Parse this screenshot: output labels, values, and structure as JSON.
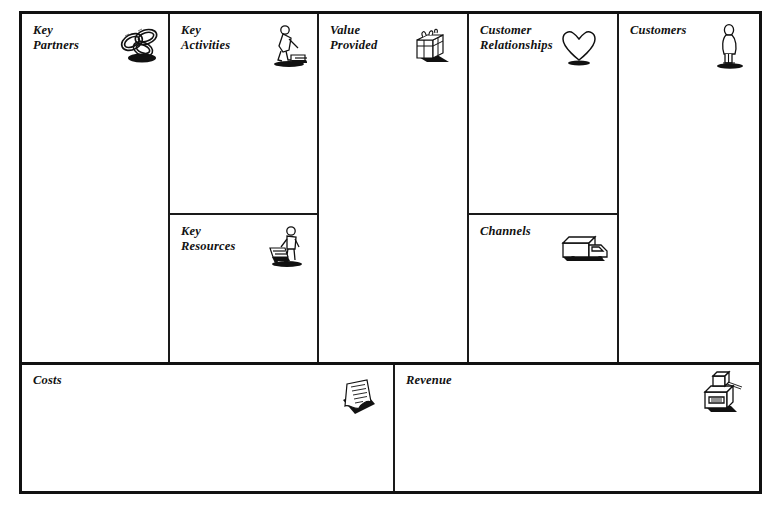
{
  "document": {
    "type": "Business Model Canvas",
    "background_color": "#ffffff",
    "line_color": "#111111",
    "text_color": "#111111"
  },
  "blocks": {
    "key_partners": {
      "label": "Key\nPartners",
      "icon": "interlocking-rings-icon"
    },
    "key_activities": {
      "label": "Key\nActivities",
      "icon": "person-sweeping-icon"
    },
    "key_resources": {
      "label": "Key\nResources",
      "icon": "person-with-cart-icon"
    },
    "value_provided": {
      "label": "Value\nProvided",
      "icon": "gift-box-icon"
    },
    "customer_relationships": {
      "label": "Customer\nRelationships",
      "icon": "heart-icon"
    },
    "channels": {
      "label": "Channels",
      "icon": "delivery-truck-icon"
    },
    "customers": {
      "label": "Customers",
      "icon": "standing-person-icon"
    },
    "costs": {
      "label": "Costs",
      "icon": "invoice-document-icon"
    },
    "revenue": {
      "label": "Revenue",
      "icon": "cash-register-icon"
    }
  }
}
